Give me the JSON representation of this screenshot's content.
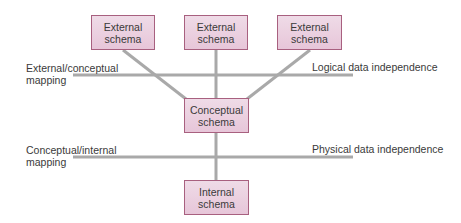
{
  "diagram": {
    "type": "three-schema-architecture",
    "colors": {
      "box_fill_top": "#efdbe7",
      "box_fill_bottom": "#e7c6d9",
      "box_border": "#a8607f",
      "line": "#a9a9a9",
      "text": "#3a3a3a"
    },
    "external_schemas": [
      {
        "line1": "External",
        "line2": "schema"
      },
      {
        "line1": "External",
        "line2": "schema"
      },
      {
        "line1": "External",
        "line2": "schema"
      }
    ],
    "conceptual_schema": {
      "line1": "Conceptual",
      "line2": "schema"
    },
    "internal_schema": {
      "line1": "Internal",
      "line2": "schema"
    },
    "mappings": {
      "external_conceptual": {
        "line1": "External/conceptual",
        "line2": "mapping"
      },
      "conceptual_internal": {
        "line1": "Conceptual/internal",
        "line2": "mapping"
      }
    },
    "independence": {
      "logical": "Logical data independence",
      "physical": "Physical data independence"
    }
  }
}
